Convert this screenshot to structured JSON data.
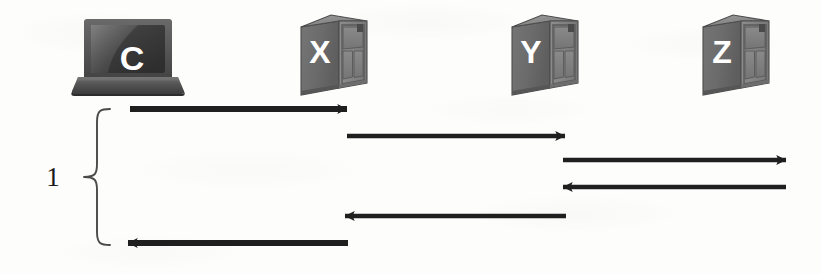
{
  "diagram": {
    "background_color": "#fdfdfc",
    "stroke_color": "#1f1f1f",
    "nodes": [
      {
        "id": "C",
        "label": "C",
        "type": "laptop-icon",
        "icon_name": "laptop-client-icon",
        "center_x": 128,
        "center_y": 55,
        "body_color": "#5d5d5d",
        "screen_color": "#3a3a3a",
        "label_color": "#ffffff"
      },
      {
        "id": "X",
        "label": "X",
        "type": "server-tower-icon",
        "icon_name": "server-tower-icon-x",
        "center_x": 333,
        "center_y": 55,
        "body_color": "#6a6a6a",
        "face_color": "#848484",
        "top_color": "#8e8e8e",
        "label_color": "#ffffff"
      },
      {
        "id": "Y",
        "label": "Y",
        "type": "server-tower-icon",
        "icon_name": "server-tower-icon-y",
        "center_x": 544,
        "center_y": 55,
        "body_color": "#6a6a6a",
        "face_color": "#848484",
        "top_color": "#8e8e8e",
        "label_color": "#ffffff"
      },
      {
        "id": "Z",
        "label": "Z",
        "type": "server-tower-icon",
        "icon_name": "server-tower-icon-z",
        "center_x": 735,
        "center_y": 55,
        "body_color": "#6a6a6a",
        "face_color": "#848484",
        "top_color": "#8e8e8e",
        "label_color": "#ffffff"
      }
    ],
    "messages": [
      {
        "index": 1,
        "from": "C",
        "to": "X",
        "direction": "right",
        "x1": 130,
        "x2": 347,
        "y": 109
      },
      {
        "index": 2,
        "from": "X",
        "to": "Y",
        "direction": "right",
        "x1": 347,
        "x2": 565,
        "y": 136
      },
      {
        "index": 3,
        "from": "Y",
        "to": "Z",
        "direction": "right",
        "x1": 563,
        "x2": 786,
        "y": 160
      },
      {
        "index": 4,
        "from": "Z",
        "to": "Y",
        "direction": "left",
        "x1": 563,
        "x2": 786,
        "y": 187
      },
      {
        "index": 5,
        "from": "Y",
        "to": "X",
        "direction": "left",
        "x1": 345,
        "x2": 566,
        "y": 216
      },
      {
        "index": 6,
        "from": "X",
        "to": "C",
        "direction": "left",
        "x1": 128,
        "x2": 348,
        "y": 243
      }
    ],
    "group_brace": {
      "label": "1",
      "label_x": 53,
      "label_y": 186,
      "brace_x": 97,
      "brace_top": 109,
      "brace_bottom": 245,
      "stroke_color": "#4a4a4a"
    }
  }
}
